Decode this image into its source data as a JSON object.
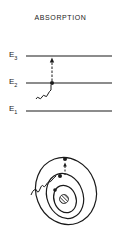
{
  "diagram": {
    "title": "ABSORPTION",
    "levels": [
      {
        "label": "E",
        "sub": "3"
      },
      {
        "label": "E",
        "sub": "2"
      },
      {
        "label": "E",
        "sub": "1"
      }
    ],
    "colors": {
      "ink": "#1a1a1a",
      "background": "#ffffff"
    }
  }
}
